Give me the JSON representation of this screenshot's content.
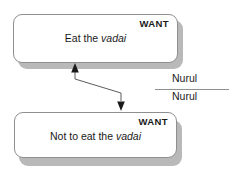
{
  "diagram": {
    "colors": {
      "box_border": "#8f8f8f",
      "box_fill": "#ffffff",
      "shadow": "#b9b9b9",
      "text": "#1a1a1a",
      "connector": "#4a4a4a"
    },
    "nodes": [
      {
        "id": "want-eat",
        "header": "WANT",
        "text_before": "Eat the ",
        "text_emphasis": "vadai",
        "text_after": ""
      },
      {
        "id": "want-not-eat",
        "header": "WANT",
        "text_before": "Not to eat the ",
        "text_emphasis": "vadai",
        "text_after": ""
      }
    ],
    "annotations": [
      {
        "id": "nurul-top",
        "label": "Nurul"
      },
      {
        "id": "nurul-bottom",
        "label": "Nurul"
      }
    ],
    "connector": {
      "name": "double-headed-zigzag-arrow",
      "from_node": "want-eat",
      "to_node": "want-not-eat"
    }
  }
}
